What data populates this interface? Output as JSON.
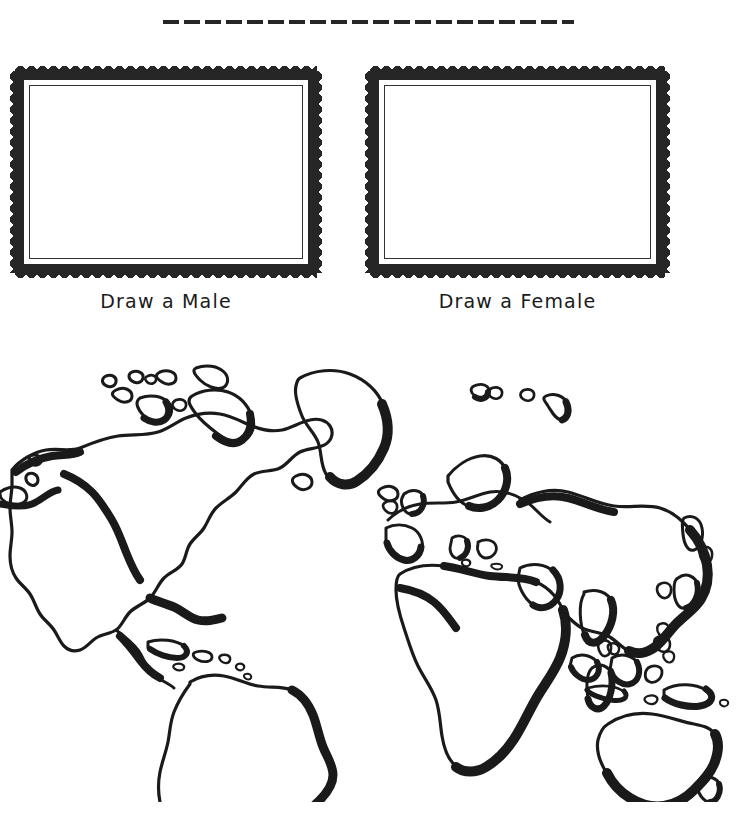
{
  "page": {
    "background_color": "#ffffff",
    "ink_color": "#262626"
  },
  "divider": {
    "name": "dashed-rule",
    "style": "dashed",
    "dash_length_px": 16,
    "gap_length_px": 5,
    "thickness_px": 4,
    "color": "#262626"
  },
  "frames": [
    {
      "id": "male",
      "caption": "Draw a Male",
      "border_style": "scalloped",
      "border_color": "#262626",
      "fill": "#ffffff",
      "content": ""
    },
    {
      "id": "female",
      "caption": "Draw a Female",
      "border_style": "scalloped",
      "border_color": "#262626",
      "fill": "#ffffff",
      "content": ""
    }
  ],
  "map": {
    "name": "world-map",
    "style": "line-art-outline",
    "stroke_color": "#1a1a1a",
    "fill": "#ffffff",
    "projection": "equirectangular",
    "regions": [
      "North America",
      "South America",
      "Greenland",
      "Europe",
      "Africa",
      "Asia",
      "Australia",
      "New Zealand",
      "Indonesia",
      "Japan",
      "Madagascar",
      "British Isles",
      "Iceland",
      "Arctic Archipelago"
    ]
  }
}
